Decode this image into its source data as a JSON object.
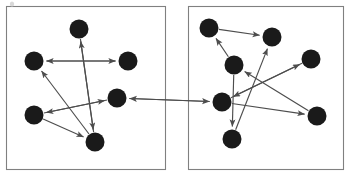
{
  "figure": {
    "background_color": "#ffffff",
    "width": 349,
    "height": 176,
    "node_color": "#1a1a1a",
    "edge_color": "#4d4d4d",
    "panel_border_color": "#808080",
    "node_radius": 9.5,
    "speck": {
      "x": 12,
      "y": 4,
      "rx": 2.2,
      "ry": 2.6,
      "color": "#d8d8d8"
    }
  },
  "panels": [
    {
      "id": "left-panel",
      "label": "Left graph panel",
      "x": 6.5,
      "y": 6.5,
      "width": 159,
      "height": 163,
      "nodes": [
        {
          "id": "L1",
          "label": "left-node-top",
          "cx": 79,
          "cy": 29
        },
        {
          "id": "L2",
          "label": "left-node-west",
          "cx": 34,
          "cy": 61
        },
        {
          "id": "L3",
          "label": "left-node-east",
          "cx": 128,
          "cy": 61
        },
        {
          "id": "L4",
          "label": "left-node-center",
          "cx": 117,
          "cy": 98
        },
        {
          "id": "L5",
          "label": "left-node-southwest",
          "cx": 34,
          "cy": 115
        },
        {
          "id": "L6",
          "label": "left-node-bottom",
          "cx": 95,
          "cy": 142
        }
      ],
      "edges": [
        {
          "from": "L3",
          "to": "L2",
          "arrows": "both",
          "label": "east-west-bidirectional"
        },
        {
          "from": "L6",
          "to": "L1",
          "arrows": "forward",
          "label": "bottom-to-top"
        },
        {
          "from": "L1",
          "to": "L6",
          "arrows": "forward",
          "label": "top-to-bottom"
        },
        {
          "from": "L6",
          "to": "L2",
          "arrows": "forward",
          "label": "bottom-to-west"
        },
        {
          "from": "L5",
          "to": "L6",
          "arrows": "forward",
          "label": "southwest-to-bottom"
        },
        {
          "from": "L5",
          "to": "L4",
          "arrows": "forward",
          "label": "southwest-to-center"
        },
        {
          "from": "L4",
          "to": "L5",
          "arrows": "forward",
          "label": "center-to-southwest"
        }
      ]
    },
    {
      "id": "right-panel",
      "label": "Right graph panel",
      "x": 188.5,
      "y": 6.5,
      "width": 155,
      "height": 163,
      "nodes": [
        {
          "id": "R1",
          "label": "right-node-topleft",
          "cx": 209,
          "cy": 28
        },
        {
          "id": "R2",
          "label": "right-node-topright",
          "cx": 272,
          "cy": 37
        },
        {
          "id": "R3",
          "label": "right-node-upmid",
          "cx": 234,
          "cy": 65
        },
        {
          "id": "R4",
          "label": "right-node-east",
          "cx": 311,
          "cy": 59
        },
        {
          "id": "R5",
          "label": "right-node-center",
          "cx": 222,
          "cy": 102
        },
        {
          "id": "R6",
          "label": "right-node-southeast",
          "cx": 317,
          "cy": 116
        },
        {
          "id": "R7",
          "label": "right-node-bottom",
          "cx": 232,
          "cy": 139
        }
      ],
      "edges": [
        {
          "from": "R1",
          "to": "R2",
          "arrows": "forward",
          "label": "topleft-to-topright"
        },
        {
          "from": "R3",
          "to": "R1",
          "arrows": "forward",
          "label": "upmid-to-topleft"
        },
        {
          "from": "R7",
          "to": "R2",
          "arrows": "forward",
          "label": "bottom-to-topright"
        },
        {
          "from": "R5",
          "to": "R4",
          "arrows": "forward",
          "label": "center-to-east"
        },
        {
          "from": "R6",
          "to": "R3",
          "arrows": "forward",
          "label": "southeast-to-upmid"
        },
        {
          "from": "R4",
          "to": "R5",
          "arrows": "forward",
          "label": "east-to-center-back"
        },
        {
          "from": "R3",
          "to": "R7",
          "arrows": "forward",
          "label": "upmid-to-bottom"
        },
        {
          "from": "R5",
          "to": "R6",
          "arrows": "forward",
          "label": "center-to-southeast"
        }
      ]
    }
  ],
  "cross_panel_edges": [
    {
      "id": "X1",
      "label": "left-center-to-right-center-bidirectional",
      "from": "L4",
      "to": "R5",
      "arrows": "both"
    }
  ]
}
